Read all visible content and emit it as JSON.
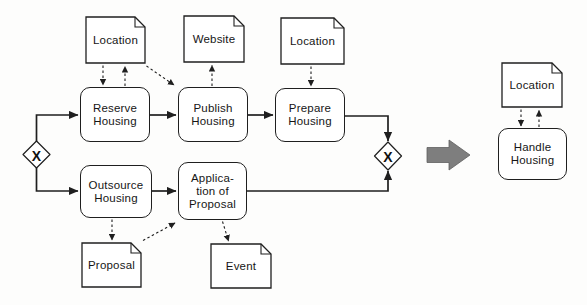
{
  "nodes": {
    "location_top_left": {
      "type": "document",
      "lines": [
        "Location"
      ]
    },
    "website": {
      "type": "document",
      "lines": [
        "Website"
      ]
    },
    "location_top_right": {
      "type": "document",
      "lines": [
        "Location"
      ]
    },
    "reserve_housing": {
      "type": "task",
      "lines": [
        "Reserve",
        "Housing"
      ]
    },
    "publish_housing": {
      "type": "task",
      "lines": [
        "Publish",
        "Housing"
      ]
    },
    "prepare_housing": {
      "type": "task",
      "lines": [
        "Prepare",
        "Housing"
      ]
    },
    "outsource_housing": {
      "type": "task",
      "lines": [
        "Outsource",
        "Housing"
      ]
    },
    "application_of_proposal": {
      "type": "task",
      "lines": [
        "Applica-",
        "tion of",
        "Proposal"
      ]
    },
    "proposal": {
      "type": "document",
      "lines": [
        "Proposal"
      ]
    },
    "event": {
      "type": "document",
      "lines": [
        "Event"
      ]
    },
    "location_result": {
      "type": "document",
      "lines": [
        "Location"
      ]
    },
    "handle_housing": {
      "type": "task",
      "lines": [
        "Handle",
        "Housing"
      ]
    }
  },
  "gateways": {
    "left": {
      "label": "X"
    },
    "right": {
      "label": "X"
    }
  },
  "colors": {
    "background": "#fdfdfc",
    "node_fill": "#ffffff",
    "stroke": "#1f1f1f",
    "maps_arrow": "#7e7e7e"
  }
}
